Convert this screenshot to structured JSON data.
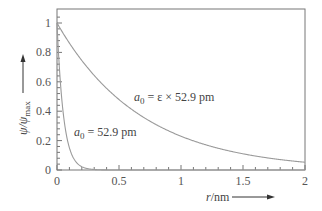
{
  "chart_data": {
    "type": "line",
    "title": "",
    "xlabel_var": "r",
    "xlabel_unit": "/nm",
    "ylabel_var": "ψ/ψ",
    "ylabel_sub": "max",
    "xlim": [
      0,
      2
    ],
    "ylim": [
      0,
      1.05
    ],
    "x_ticks": [
      "0",
      "0.5",
      "1",
      "1.5",
      "2"
    ],
    "y_ticks": [
      "0",
      "0.2",
      "0.4",
      "0.6",
      "0.8",
      "1"
    ],
    "grid": false,
    "series": [
      {
        "name": "a0 = 52.9 pm",
        "label_var": "a",
        "label_sub": "0",
        "label_rest": " = 52.9 pm",
        "decay_length_nm": 0.0529,
        "x": [
          0,
          0.05,
          0.1,
          0.15,
          0.2,
          0.25,
          0.3,
          0.4
        ],
        "values": [
          1.0,
          0.39,
          0.15,
          0.06,
          0.02,
          0.01,
          0.0,
          0.0
        ]
      },
      {
        "name": "a0 = ε × 52.9 pm",
        "label_var": "a",
        "label_sub": "0",
        "label_rest": " = ε × 52.9 pm",
        "decay_length_nm": 0.68,
        "x": [
          0,
          0.25,
          0.5,
          0.75,
          1.0,
          1.25,
          1.5,
          1.75,
          2.0
        ],
        "values": [
          1.0,
          0.69,
          0.48,
          0.33,
          0.23,
          0.16,
          0.11,
          0.08,
          0.05
        ]
      }
    ]
  },
  "colors": {
    "axis": "#555555",
    "curve": "#9a9a9a",
    "text": "#444444"
  }
}
